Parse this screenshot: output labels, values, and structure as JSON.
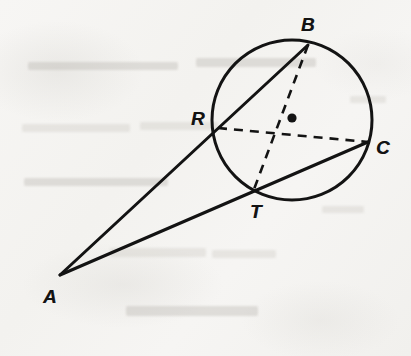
{
  "figure": {
    "kind": "euclidean-geometry-diagram",
    "caption": "Circle with external point A; two secants from A meeting the circle at R, B and at T, C",
    "background_color": "#f5f4f2",
    "ink_color": "#131313"
  },
  "circle": {
    "name": "main-circle",
    "center_x": 292,
    "center_y": 120,
    "radius": 80,
    "stroke_width": 3.0,
    "center_dot_x": 292,
    "center_dot_y": 118,
    "center_dot_radius": 4.6
  },
  "points": [
    {
      "id": "A",
      "label": "A",
      "x": 60,
      "y": 275,
      "label_x": 50,
      "label_y": 296,
      "on_circle": false,
      "role": "external-apex"
    },
    {
      "id": "B",
      "label": "B",
      "x": 308,
      "y": 45,
      "label_x": 308,
      "label_y": 24,
      "on_circle": true,
      "role": "secant-far-point"
    },
    {
      "id": "R",
      "label": "R",
      "x": 218,
      "y": 128,
      "label_x": 198,
      "label_y": 118,
      "on_circle": true,
      "role": "secant-near-point"
    },
    {
      "id": "C",
      "label": "C",
      "x": 368,
      "y": 142,
      "label_x": 383,
      "label_y": 147,
      "on_circle": true,
      "role": "secant-far-point"
    },
    {
      "id": "T",
      "label": "T",
      "x": 253,
      "y": 192,
      "label_x": 256,
      "label_y": 211,
      "on_circle": true,
      "role": "secant-near-point"
    }
  ],
  "solid_segments": [
    {
      "id": "secant-A-R-B",
      "from": "A",
      "to": "B",
      "x1": 60,
      "y1": 275,
      "x2": 308,
      "y2": 45,
      "passes_through": "R",
      "stroke_width": 3.0
    },
    {
      "id": "secant-A-T-C",
      "from": "A",
      "to": "C",
      "x1": 60,
      "y1": 275,
      "x2": 368,
      "y2": 142,
      "passes_through": "T",
      "stroke_width": 3.0
    }
  ],
  "dashed_segments": [
    {
      "id": "chord-R-C",
      "from": "R",
      "to": "C",
      "x1": 218,
      "y1": 128,
      "x2": 368,
      "y2": 142,
      "stroke_width": 2.6,
      "dash": "9 7"
    },
    {
      "id": "chord-B-T",
      "from": "B",
      "to": "T",
      "x1": 308,
      "y1": 45,
      "x2": 253,
      "y2": 192,
      "stroke_width": 2.6,
      "dash": "9 7"
    }
  ],
  "bleed_marks": [
    {
      "x": 28,
      "y": 62,
      "w": 150,
      "h": 8,
      "soft": false
    },
    {
      "x": 196,
      "y": 58,
      "w": 120,
      "h": 9,
      "soft": false
    },
    {
      "x": 22,
      "y": 124,
      "w": 108,
      "h": 8,
      "soft": true
    },
    {
      "x": 140,
      "y": 122,
      "w": 78,
      "h": 8,
      "soft": true
    },
    {
      "x": 24,
      "y": 178,
      "w": 144,
      "h": 8,
      "soft": false
    },
    {
      "x": 110,
      "y": 248,
      "w": 96,
      "h": 9,
      "soft": true
    },
    {
      "x": 212,
      "y": 250,
      "w": 64,
      "h": 8,
      "soft": true
    },
    {
      "x": 126,
      "y": 306,
      "w": 132,
      "h": 10,
      "soft": false
    },
    {
      "x": 322,
      "y": 206,
      "w": 42,
      "h": 7,
      "soft": true
    },
    {
      "x": 350,
      "y": 96,
      "w": 36,
      "h": 7,
      "soft": true
    }
  ]
}
